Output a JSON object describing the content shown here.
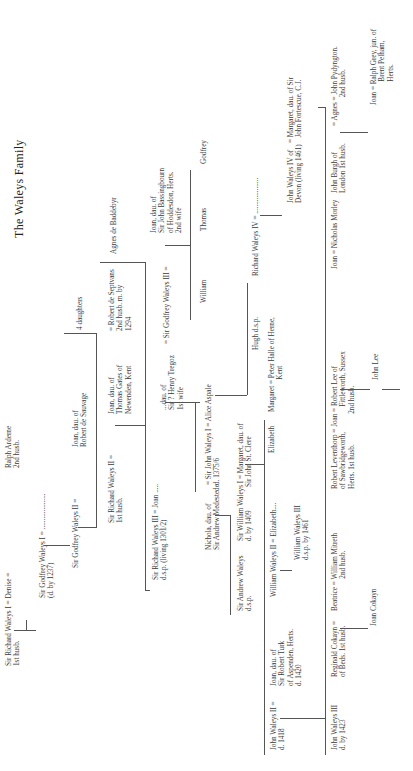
{
  "title": "The Waleys Family",
  "people": {
    "sir_richard_waleys_i": "Sir Richard Waleys I = Denise =\n1st husb.",
    "ralph_arderne": "Ralph Arderne\n2nd husb.",
    "sir_godfrey_waleys_i": "Sir Godfrey Waleys I = ....................\n(d. by 1237)",
    "sir_godfrey_waleys_ii": "Sir Godfrey Waleys II =",
    "joan_sauvage": "Joan, dau. of\nRobert de Sauvage",
    "four_daughters": "4 daughters",
    "sir_richard_waleys_ii": "Sir Richard Waleys II =\n1st husb.",
    "joan_gates": "Joan, dau. of\nThomas Gates of\nNewenden, Kent",
    "robert_de_septvans": "= Robert de Septvans\n2nd husb. m. by\n1294",
    "agnes_de_baddebyr": "Agnes de Baddebyr",
    "sir_richard_waleys_iii": "Sir Richard Waleys III = Joan .....\nd.s.p. (living 1301/2)",
    "dau_tregoz": "...dau. of\nSir ? Henry Tregoz\n1st wife",
    "sir_godfrey_waleys_iii": "= Sir Godfrey Waleys III =",
    "joan_bassingbourn": "Joan, dau. of\nSir John Bassingbourn\nof Hoddesdon, Herts.\n2nd wife",
    "nichola_medestede": "Nichola, dau. of\nSir Andrew Medestede",
    "sir_john_waleys_i": "= Sir John Waleys I = Alice Aspale\nd. 1375/6",
    "william": "William",
    "thomas": "Thomas",
    "godfrey": "Godfrey",
    "sir_andrew_waleys": "Sir Andrew Waleys\nd.s.p.",
    "sir_william_waleys_i": "Sir William Waleys I = Margaret, dau. of\nd. by 1409             Sir John St. Clere",
    "hugh": "Hugh d.s.p.",
    "richard_waleys_iv": "Richard Waleys IV = ....................",
    "john_waleys_iv": "John Waleys IV of\nDevon (living 1461)",
    "margaret_fortescue": "= Margaret, dau. of Sir\n   John Fortescue, C.J.",
    "john_waleys_ii": "John Waleys II =\nd. 1418",
    "joan_turk": "Joan, dau. of\nSir Robert Turk\nof Aspenden, Herts.\nd. 1420",
    "william_waleys_ii": "William Waleys II = Elizabeth....",
    "william_waleys_iii": "William Waleys III\nd.s.p. by 1461",
    "elizabeth": "Elizabeth",
    "margaret": "Margaret = Peter Halle of Herne,\n                  Kent",
    "john_waleys_iii": "John Waleys III\nd. by 1423",
    "reginald_cokayn": "Reginald Cokayn =\nof Beds. 1st husb.",
    "beatrice": "Beatrice = William Mitreth\n                  2nd husb.",
    "joan_cokayn": "Joan Cokayn",
    "robert_leventhorp": "Robert Leventhorp = Joan = Robert Lee of\nof Sawbridgeworth,              Fittleworth, Sussex\nHerts. 1st husb.                 2nd husb.",
    "john_lee": "John Lee",
    "joan_morley": "Joan = Nicholas Morley",
    "john_burgh": "John Burgh of\nLondon 1st husb.",
    "agnes_pydyngton": "= Agnes = John Pydyngton.\n                2nd husb.",
    "joan_grey": "Joan = Ralph Grey, jun. of\n             Brent Pelham,\n             Herts."
  }
}
